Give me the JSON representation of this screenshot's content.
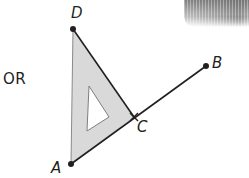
{
  "diagram": {
    "connector_text": "OR",
    "points": [
      {
        "id": "D",
        "label": "D",
        "x": 73,
        "y": 29
      },
      {
        "id": "A",
        "label": "A",
        "x": 71,
        "y": 164
      },
      {
        "id": "C",
        "label": "C",
        "x": 134,
        "y": 117
      },
      {
        "id": "B",
        "label": "B",
        "x": 206,
        "y": 66
      }
    ],
    "segments": [
      {
        "from": "A",
        "to": "B",
        "description": "line segment AB"
      },
      {
        "from": "A",
        "to": "D",
        "description": "line segment AD"
      },
      {
        "from": "D",
        "to": "C",
        "description": "line segment DC"
      }
    ],
    "tool": "set square placed with right angle edge along AD, hypotenuse through C",
    "colors": {
      "line": "#231f20",
      "set_square_fill": "#d9d9d9",
      "set_square_edge": "#8a8a8a",
      "point": "#231f20"
    }
  }
}
